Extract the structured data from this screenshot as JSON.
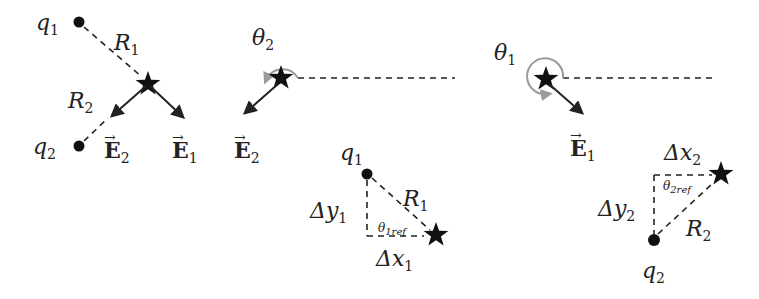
{
  "figure": {
    "panel_a": {
      "charge_1": {
        "label": "q",
        "sub": "1"
      },
      "charge_2": {
        "label": "q",
        "sub": "2"
      },
      "distance_1": {
        "label": "R",
        "sub": "1"
      },
      "distance_2": {
        "label": "R",
        "sub": "2"
      },
      "field_1": {
        "label": "E",
        "sub": "1",
        "arrow": "→"
      },
      "field_2": {
        "label": "E",
        "sub": "2",
        "arrow": "→"
      }
    },
    "panel_b": {
      "angle": {
        "label": "θ",
        "sub": "2"
      },
      "field": {
        "label": "E",
        "sub": "2",
        "arrow": "→"
      }
    },
    "panel_c": {
      "charge": {
        "label": "q",
        "sub": "1"
      },
      "distance": {
        "label": "R",
        "sub": "1"
      },
      "dy": {
        "label": "Δy",
        "sub": "1"
      },
      "dx": {
        "label": "Δx",
        "sub": "1"
      },
      "ref_angle": {
        "label": "θ",
        "sub": "1ref"
      }
    },
    "panel_d": {
      "angle": {
        "label": "θ",
        "sub": "1"
      },
      "field": {
        "label": "E",
        "sub": "1",
        "arrow": "→"
      }
    },
    "panel_e": {
      "charge": {
        "label": "q",
        "sub": "2"
      },
      "distance": {
        "label": "R",
        "sub": "2"
      },
      "dy": {
        "label": "Δy",
        "sub": "2"
      },
      "dx": {
        "label": "Δx",
        "sub": "2"
      },
      "ref_angle": {
        "label": "θ",
        "sub": "2ref"
      }
    },
    "colors": {
      "ink": "#222222",
      "angle_arc": "#9a9a9a"
    }
  }
}
